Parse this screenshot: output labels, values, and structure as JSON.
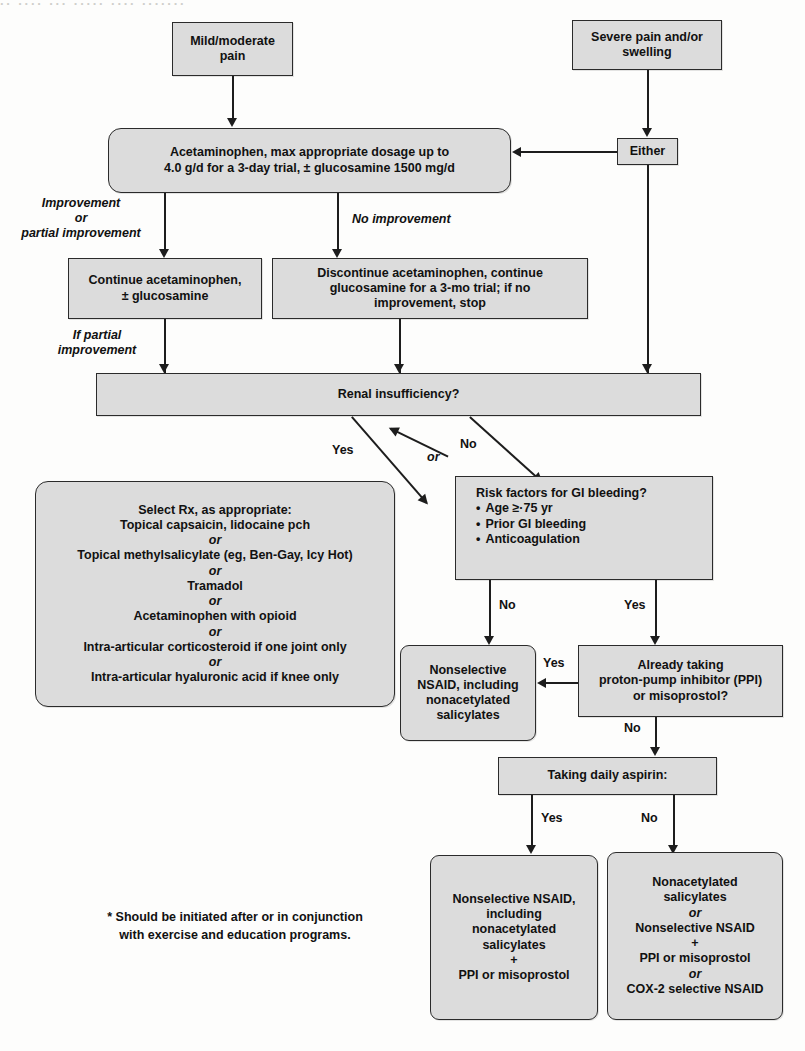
{
  "diagram": {
    "bleed_text": "·· ···· ··· ····· ···· ·······",
    "colors": {
      "node_fill": "#dcdcdc",
      "node_border": "#2b2b2b",
      "connector": "#1d1d1d",
      "text": "#111111",
      "background": "#fdfdfc"
    }
  },
  "nodes": {
    "mild_moderate_pain": {
      "line1": "Mild/moderate",
      "line2": "pain"
    },
    "severe_pain": {
      "line1": "Severe pain and/or",
      "line2": "swelling"
    },
    "either": {
      "label": "Either"
    },
    "acetaminophen_trial": {
      "line1": "Acetaminophen, max appropriate dosage up to",
      "line2": "4.0 g/d for a 3-day trial, ± glucosamine 1500 mg/d"
    },
    "continue_acetaminophen": {
      "line1": "Continue acetaminophen,",
      "line2": "± glucosamine"
    },
    "discontinue_acetaminophen": {
      "line1": "Discontinue acetaminophen, continue",
      "line2": "glucosamine for a 3-mo trial; if no",
      "line3": "improvement, stop"
    },
    "renal_insufficiency": {
      "label": "Renal insufficiency?"
    },
    "select_rx": {
      "line1": "Select Rx, as appropriate:",
      "line2": "Topical capsaicin, lidocaine pch",
      "or1": "or",
      "line3": "Topical methylsalicylate (eg, Ben-Gay, Icy Hot)",
      "or2": "or",
      "line4": "Tramadol",
      "or3": "or",
      "line5": "Acetaminophen with opioid",
      "or4": "or",
      "line6": "Intra-articular corticosteroid if one joint only",
      "or5": "or",
      "line7": "Intra-articular hyaluronic acid if knee only"
    },
    "risk_factors": {
      "heading": "Risk factors for GI bleeding?",
      "bullets": [
        "Age ≥·75 yr",
        "Prior GI bleeding",
        "Anticoagulation"
      ]
    },
    "nonselective_nsaid": {
      "line1": "Nonselective",
      "line2": "NSAID, including",
      "line3": "nonacetylated",
      "line4": "salicylates"
    },
    "already_taking_ppi": {
      "line1": "Already taking",
      "line2": "proton-pump inhibitor (PPI)",
      "line3": "or misoprostol?"
    },
    "taking_daily_aspirin": {
      "label": "Taking daily aspirin:"
    },
    "outcome_with_ppi": {
      "line1": "Nonselective NSAID,",
      "line2": "including",
      "line3": "nonacetylated",
      "line4": "salicylates",
      "plus": "+",
      "line5": "PPI or misoprostol"
    },
    "outcome_alternatives": {
      "line1": "Nonacetylated",
      "line2": "salicylates",
      "or1": "or",
      "line3": "Nonselective NSAID",
      "plus": "+",
      "line4": "PPI or misoprostol",
      "or2": "or",
      "line5": "COX-2 selective NSAID"
    }
  },
  "edge_labels": {
    "improvement": {
      "line1": "Improvement",
      "line2": "or",
      "line3": "partial improvement"
    },
    "no_improvement": "No improvement",
    "if_partial_improvement": {
      "line1": "If partial",
      "line2": "improvement"
    },
    "renal_yes": "Yes",
    "renal_or": "or",
    "renal_no": "No",
    "risk_no": "No",
    "risk_yes": "Yes",
    "ppi_yes": "Yes",
    "ppi_no": "No",
    "aspirin_yes": "Yes",
    "aspirin_no": "No"
  },
  "footnote": {
    "line1": "* Should be initiated after or in conjunction",
    "line2": "with exercise and education programs."
  }
}
